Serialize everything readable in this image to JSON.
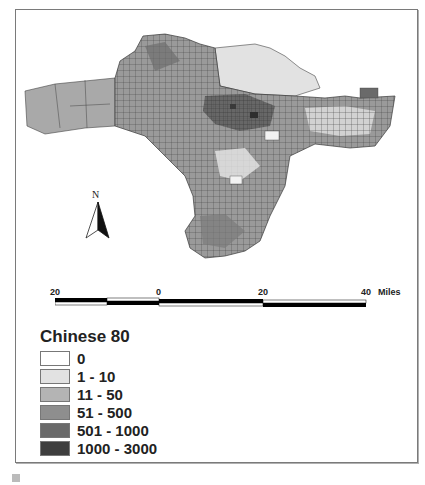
{
  "map": {
    "subject": "Chinese population by census tract, 1980",
    "region_shading": {
      "background": "#ffffff",
      "tract_border": "#3a3a3a"
    }
  },
  "north_arrow": {
    "label": "N"
  },
  "scale_bar": {
    "ticks": [
      "20",
      "0",
      "20",
      "40"
    ],
    "unit": "Miles"
  },
  "legend": {
    "title": "Chinese 80",
    "items": [
      {
        "label": "0",
        "color": "#ffffff"
      },
      {
        "label": "1 - 10",
        "color": "#e2e2e2"
      },
      {
        "label": "11 - 50",
        "color": "#b4b4b4"
      },
      {
        "label": "51 - 500",
        "color": "#8e8e8e"
      },
      {
        "label": "501 - 1000",
        "color": "#6a6a6a"
      },
      {
        "label": "1000 - 3000",
        "color": "#3e3e3e"
      }
    ]
  }
}
